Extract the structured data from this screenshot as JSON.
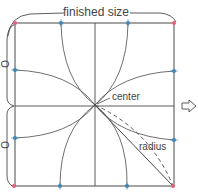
{
  "labels": {
    "finished_size": "finished size",
    "center": "center",
    "radius": "radius",
    "half_left_top": "O",
    "half_left_bottom": "O"
  },
  "colors": {
    "line": "#4a4a4a",
    "corner_dot": "#e0607e",
    "mark_dot": "#3f86b5",
    "text": "#444444"
  },
  "icons": {
    "next_arrow": "outlined-right-arrow"
  }
}
